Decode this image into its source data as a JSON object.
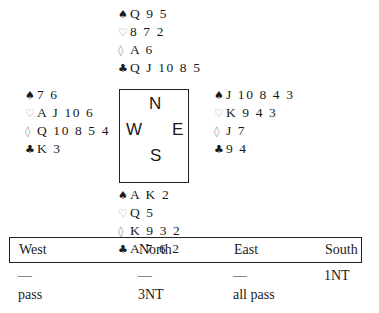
{
  "suits": {
    "spades": "♠",
    "hearts": "♡",
    "diamonds": "◊",
    "clubs": "♣"
  },
  "hands": {
    "north": {
      "spades": "Q 9 5",
      "hearts": "8 7 2",
      "diamonds": "A 6",
      "clubs": "Q J 10 8 5"
    },
    "west": {
      "spades": "7 6",
      "hearts": "A J 10 6",
      "diamonds": "Q 10 8 5 4",
      "clubs": "K 3"
    },
    "east": {
      "spades": "J 10 8 4 3",
      "hearts": "K 9 4 3",
      "diamonds": "J 7",
      "clubs": "9 4"
    },
    "south": {
      "spades": "A K 2",
      "hearts": "Q 5",
      "diamonds": "K 9 3 2",
      "clubs": "A 7 6 2"
    }
  },
  "compass": {
    "north": "N",
    "west": "W",
    "east": "E",
    "south": "S"
  },
  "auction": {
    "headers": [
      "West",
      "North",
      "East",
      "South"
    ],
    "rows": [
      [
        "—",
        "—",
        "—",
        "1NT"
      ],
      [
        "pass",
        "3NT",
        "all pass",
        ""
      ]
    ]
  },
  "colors": {
    "black_suit": "#1a1a1a",
    "red_suit_outline": "#9a9a9a",
    "border": "#222222"
  }
}
